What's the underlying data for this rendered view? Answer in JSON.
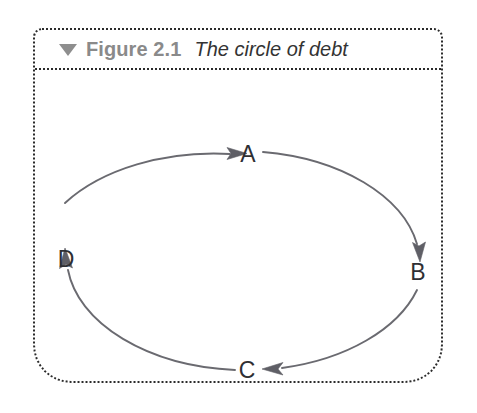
{
  "figure": {
    "collapse_icon": "triangle-down-icon",
    "number_label": "Figure 2.1",
    "title_label": "The circle of debt"
  },
  "diagram": {
    "type": "cycle-diagram",
    "shape": "ellipse",
    "direction": "clockwise",
    "stroke_color": "#6a6a70",
    "label_color": "#2f2f33",
    "nodes": [
      {
        "id": "A",
        "label": "A",
        "position": "top"
      },
      {
        "id": "B",
        "label": "B",
        "position": "right"
      },
      {
        "id": "C",
        "label": "C",
        "position": "bottom"
      },
      {
        "id": "D",
        "label": "D",
        "position": "left"
      }
    ],
    "edges": [
      {
        "from": "A",
        "to": "B",
        "arrow_at": "B"
      },
      {
        "from": "B",
        "to": "C",
        "arrow_at": "C"
      },
      {
        "from": "C",
        "to": "D",
        "arrow_at": "D"
      },
      {
        "from": "D",
        "to": "A",
        "arrow_at": "A"
      }
    ]
  },
  "colors": {
    "panel_border": "#2b2b2b",
    "caption_number": "#8a8a8a",
    "caption_title": "#333333",
    "triangle": "#8e8e8e",
    "background": "#ffffff"
  }
}
